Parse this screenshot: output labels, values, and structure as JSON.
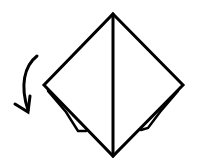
{
  "diagram": {
    "type": "origami-fold-step",
    "stroke_color": "#000000",
    "background": "#ffffff",
    "shape": "diamond",
    "elements": [
      "diamond-outline",
      "center-crease",
      "left-flap-pocket",
      "right-flap-pocket",
      "turn-over-arrow"
    ]
  }
}
